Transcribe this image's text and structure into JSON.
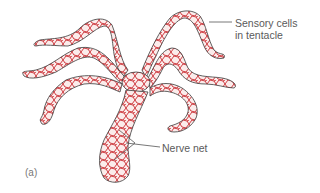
{
  "figure": {
    "panel_label": "(a)",
    "colors": {
      "outline": "#3a3a3a",
      "nerve": "#c8262b",
      "fill": "#fbeceb",
      "label_text": "#5a5a5a",
      "leader_line": "#555555"
    }
  },
  "labels": {
    "sensory": [
      "Sensory cells",
      "in tentacle"
    ],
    "nerve": "Nerve net"
  }
}
